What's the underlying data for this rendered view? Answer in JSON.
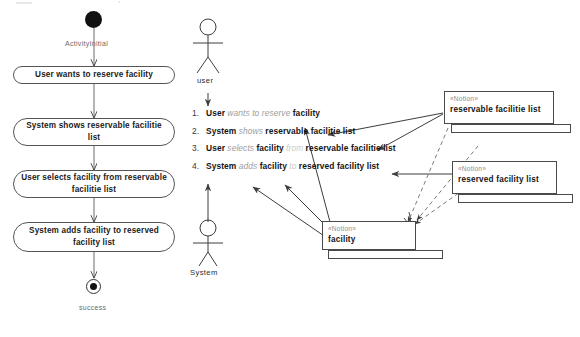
{
  "diagram": {
    "type": "uml-activity-and-notion-mapping",
    "activity": {
      "initial_label": "ActivityInitial",
      "final_label": "success",
      "nodes": [
        {
          "id": "a1",
          "text": "User wants to reserve facility"
        },
        {
          "id": "a2",
          "text": "System shows reservable facilitie list"
        },
        {
          "id": "a3",
          "text": "User selects facility from reservable facilitie list"
        },
        {
          "id": "a4",
          "text": "System adds facility to reserved facility list"
        }
      ]
    },
    "actors": [
      {
        "id": "actor-user",
        "label": "user"
      },
      {
        "id": "actor-system",
        "label": "System"
      }
    ],
    "steps": [
      {
        "num": "1.",
        "tokens": [
          {
            "t": "User",
            "style": "kw"
          },
          {
            "t": "wants to reserve",
            "style": "verb"
          },
          {
            "t": "facility",
            "style": "kw"
          }
        ]
      },
      {
        "num": "2.",
        "tokens": [
          {
            "t": "System",
            "style": "kw"
          },
          {
            "t": "shows",
            "style": "verb"
          },
          {
            "t": "reservable facilitie list",
            "style": "kw"
          }
        ]
      },
      {
        "num": "3.",
        "tokens": [
          {
            "t": "User",
            "style": "kw"
          },
          {
            "t": "selects",
            "style": "verb"
          },
          {
            "t": "facility",
            "style": "kw"
          },
          {
            "t": "from",
            "style": "prep"
          },
          {
            "t": "reservable facilitie list",
            "style": "kw"
          }
        ]
      },
      {
        "num": "4.",
        "tokens": [
          {
            "t": "System",
            "style": "kw"
          },
          {
            "t": "adds",
            "style": "verb"
          },
          {
            "t": "facility",
            "style": "kw"
          },
          {
            "t": "to",
            "style": "prep"
          },
          {
            "t": "reserved facility list",
            "style": "kw"
          }
        ]
      }
    ],
    "notions": [
      {
        "id": "notion-reservable",
        "stereotype": "«Notion»",
        "name": "reservable facilitie list"
      },
      {
        "id": "notion-reserved",
        "stereotype": "«Notion»",
        "name": "reserved facility list"
      },
      {
        "id": "notion-facility",
        "stereotype": "«Notion»",
        "name": "facility"
      }
    ],
    "colors": {
      "stroke": "#4a4a4a",
      "text": "#141414",
      "muted": "#9c9c9c",
      "faint": "#cacaca",
      "background": "#ffffff"
    }
  }
}
